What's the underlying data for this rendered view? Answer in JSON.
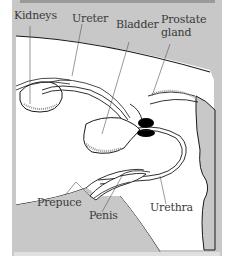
{
  "diagram": {
    "type": "anatomical-illustration",
    "colors": {
      "panel_background": "#c8c8c8",
      "body_fill": "#ffffff",
      "outline": "#1a1a1a",
      "gland": "#000000",
      "label_text": "#3a3a3a"
    },
    "labels": {
      "kidneys": "Kidneys",
      "ureter": "Ureter",
      "bladder": "Bladder",
      "prostate_line1": "Prostate",
      "prostate_line2": "gland",
      "prepuce": "Prepuce",
      "penis": "Penis",
      "urethra": "Urethra"
    }
  }
}
